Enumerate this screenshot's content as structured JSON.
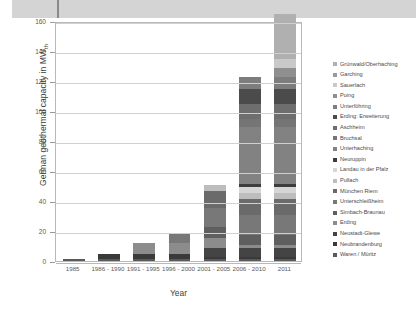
{
  "chart_data": {
    "type": "bar",
    "stacked": true,
    "title": "",
    "xlabel": "Year",
    "ylabel": "German geothermal capacity in MW",
    "ylabel_sub": "th",
    "ylim": [
      0,
      160
    ],
    "yticks": [
      0,
      20,
      40,
      60,
      80,
      100,
      120,
      140,
      160
    ],
    "grid": "horizontal",
    "legend_position": "right",
    "categories": [
      "1985",
      "1986 - 1990",
      "1991 - 1995",
      "1996 - 2000",
      "2001 - 2005",
      "2006 - 2010",
      "2011"
    ],
    "totals": [
      1.5,
      5,
      13,
      20,
      51,
      122,
      152
    ],
    "series": [
      {
        "name": "Grünwald/Oberhaching",
        "color": "#b0b0b0",
        "values": [
          0,
          0,
          0,
          0,
          0,
          0,
          30
        ]
      },
      {
        "name": "Garching",
        "color": "#9a9a9a",
        "values": [
          0,
          0,
          0,
          0,
          0,
          0,
          0
        ]
      },
      {
        "name": "Sauerlach",
        "color": "#c9c9c9",
        "values": [
          0,
          0,
          0,
          0,
          0,
          0,
          6
        ]
      },
      {
        "name": "Poing",
        "color": "#8f8f8f",
        "values": [
          0,
          0,
          0,
          0,
          0,
          0,
          6
        ]
      },
      {
        "name": "Unterföhring",
        "color": "#7d7d7d",
        "values": [
          0,
          0,
          0,
          0,
          0,
          8,
          8
        ]
      },
      {
        "name": "Erding: Erweiterung",
        "color": "#4b4b4b",
        "values": [
          0,
          0,
          0,
          0,
          0,
          10,
          10
        ]
      },
      {
        "name": "Aschheim",
        "color": "#6e6e6e",
        "values": [
          0,
          0,
          0,
          0,
          0,
          10,
          10
        ]
      },
      {
        "name": "Bruchsal",
        "color": "#757575",
        "values": [
          0,
          0,
          0,
          0,
          0,
          5,
          5
        ]
      },
      {
        "name": "Unterhaching",
        "color": "#828282",
        "values": [
          0,
          0,
          0,
          0,
          0,
          38,
          38
        ]
      },
      {
        "name": "Neuruppin",
        "color": "#3d3d3d",
        "values": [
          0,
          0,
          0,
          0,
          0,
          2,
          2
        ]
      },
      {
        "name": "Landau in der Pfalz",
        "color": "#d6d6d6",
        "values": [
          0,
          0,
          0,
          0,
          0,
          4,
          4
        ]
      },
      {
        "name": "Pullach",
        "color": "#bdbdbd",
        "values": [
          0,
          0,
          0,
          0,
          4,
          4,
          4
        ]
      },
      {
        "name": "München Riem",
        "color": "#6a6a6a",
        "values": [
          0,
          0,
          0,
          0,
          11,
          11,
          11
        ]
      },
      {
        "name": "Unterschleißheim",
        "color": "#787878",
        "values": [
          0,
          0,
          0,
          7,
          13,
          13,
          13
        ]
      },
      {
        "name": "Simbach-Braunau",
        "color": "#5f5f5f",
        "values": [
          0,
          0,
          0,
          0,
          7,
          7,
          7
        ]
      },
      {
        "name": "Erding",
        "color": "#8c8c8c",
        "values": [
          0,
          0,
          7,
          7,
          7,
          2,
          2
        ]
      },
      {
        "name": "Neustadt-Glewe",
        "color": "#444444",
        "values": [
          0,
          0,
          0,
          0,
          6,
          6,
          6
        ]
      },
      {
        "name": "Neubrandenburg",
        "color": "#3a3a3a",
        "values": [
          0,
          3.5,
          3.5,
          3.5,
          1,
          1,
          1
        ]
      },
      {
        "name": "Waren / Müritz",
        "color": "#5a5a5a",
        "values": [
          1.5,
          1.5,
          1.5,
          1.5,
          1.5,
          1.5,
          1.5
        ]
      }
    ]
  },
  "legend": {
    "items": [
      "Grünwald/Oberhaching",
      "Garching",
      "Sauerlach",
      "Poing",
      "Unterföhring",
      "Erding: Erweiterung",
      "Aschheim",
      "Bruchsal",
      "Unterhaching",
      "Neuruppin",
      "Landau in der Pfalz",
      "Pullach",
      "München Riem",
      "Unterschleißheim",
      "Simbach-Braunau",
      "Erding",
      "Neustadt-Glewe",
      "Neubrandenburg",
      "Waren / Müritz"
    ],
    "colors": [
      "#b0b0b0",
      "#9a9a9a",
      "#c9c9c9",
      "#8f8f8f",
      "#7d7d7d",
      "#4b4b4b",
      "#6e6e6e",
      "#757575",
      "#828282",
      "#3d3d3d",
      "#d6d6d6",
      "#bdbdbd",
      "#6a6a6a",
      "#787878",
      "#5f5f5f",
      "#8c8c8c",
      "#444444",
      "#3a3a3a",
      "#5a5a5a"
    ]
  },
  "axes": {
    "y_title_main": "German geothermal capacity in MW",
    "y_title_sub": "th",
    "x_title": "Year",
    "y_tick_labels": [
      "0",
      "20",
      "40",
      "60",
      "80",
      "100",
      "120",
      "140",
      "160"
    ],
    "x_tick_labels": [
      "1985",
      "1986 - 1990",
      "1991 - 1995",
      "1996 - 2000",
      "2001 - 2005",
      "2006 - 2010",
      "2011"
    ]
  }
}
